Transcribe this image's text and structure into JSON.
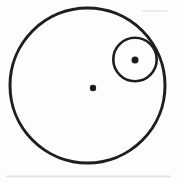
{
  "figure": {
    "canvas": {
      "width": 177,
      "height": 182
    },
    "background_color": "#fdfdfd",
    "stroke_color": "#1e1e1e",
    "dot_color": "#1a1a1a",
    "circles": [
      {
        "name": "outer-circle",
        "cx": 87.5,
        "cy": 85.5,
        "r": 77.5,
        "stroke_width": 3
      },
      {
        "name": "inner-circle",
        "cx": 135,
        "cy": 59.5,
        "r": 21.7,
        "stroke_width": 2.6
      }
    ],
    "dots": [
      {
        "name": "outer-circle-center-dot",
        "cx": 93,
        "cy": 88,
        "r": 3.2
      },
      {
        "name": "inner-circle-center-dot",
        "cx": 135,
        "cy": 60,
        "r": 3.5
      }
    ],
    "artifacts": [
      {
        "name": "scan-smudge-bottom",
        "x": 6,
        "y": 175.5,
        "width": 165,
        "height": 1.8,
        "color": "#cccccc",
        "opacity": 0.55
      },
      {
        "name": "scan-smudge-top-right",
        "x": 142,
        "y": 10,
        "width": 26,
        "height": 2,
        "color": "#d9d9d9",
        "opacity": 0.45
      }
    ]
  }
}
